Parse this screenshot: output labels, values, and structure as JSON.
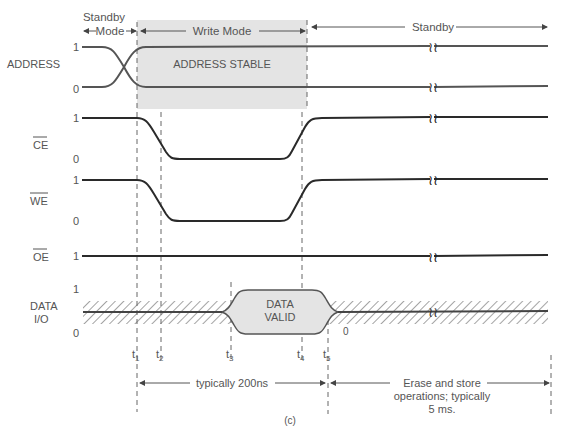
{
  "figure": {
    "caption": "(c)",
    "modes": {
      "standby_left": [
        "Standby",
        "Mode"
      ],
      "write": "Write Mode",
      "standby_right": "Standby"
    },
    "signals": [
      {
        "name": "ADDRESS",
        "overbar": false,
        "levels": [
          "1",
          "0"
        ],
        "annotation": "ADDRESS STABLE"
      },
      {
        "name": "CE",
        "overbar": true,
        "levels": [
          "1",
          "0"
        ]
      },
      {
        "name": "WE",
        "overbar": true,
        "levels": [
          "1",
          "0"
        ]
      },
      {
        "name": "OE",
        "overbar": true,
        "levels": [
          "1"
        ]
      },
      {
        "name": "DATA I/O",
        "name_lines": [
          "DATA",
          "I/O"
        ],
        "overbar": false,
        "levels": [
          "1",
          "0"
        ],
        "annotation": [
          "DATA",
          "VALID"
        ],
        "tail_level": "0"
      }
    ],
    "time_markers": [
      "t1",
      "t2",
      "t3",
      "t4",
      "t5"
    ],
    "intervals": {
      "write": "typically 200ns",
      "store": [
        "Erase and store",
        "operations; typically",
        "5 ms."
      ]
    },
    "colors": {
      "shade": "#e4e4e4",
      "line": "#2a2a2a",
      "text": "#555555"
    }
  }
}
